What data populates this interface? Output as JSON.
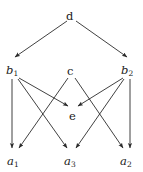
{
  "figure": {
    "type": "directed-graph",
    "title": "",
    "background_color": "#ffffff",
    "edge_color": "#2b2b2b",
    "label_color": "#1a1a1a"
  },
  "nodes": [
    {
      "id": "d",
      "base": "d",
      "sub": "",
      "italic": false,
      "x": 71,
      "y": 14,
      "label_left": 66,
      "label_top": 7
    },
    {
      "id": "b1",
      "base": "b",
      "sub": "1",
      "italic": true,
      "x": 14,
      "y": 68,
      "label_left": 6,
      "label_top": 61
    },
    {
      "id": "c",
      "base": "c",
      "sub": "",
      "italic": false,
      "x": 71,
      "y": 68,
      "label_left": 67,
      "label_top": 62
    },
    {
      "id": "b2",
      "base": "b",
      "sub": "2",
      "italic": true,
      "x": 128,
      "y": 68,
      "label_left": 121,
      "label_top": 61
    },
    {
      "id": "e",
      "base": "e",
      "sub": "",
      "italic": false,
      "x": 73,
      "y": 113,
      "label_left": 69,
      "label_top": 107
    },
    {
      "id": "a1",
      "base": "a",
      "sub": "1",
      "italic": true,
      "x": 14,
      "y": 158,
      "label_left": 7,
      "label_top": 152
    },
    {
      "id": "a3",
      "base": "a",
      "sub": "3",
      "italic": true,
      "x": 71,
      "y": 158,
      "label_left": 64,
      "label_top": 152
    },
    {
      "id": "a2",
      "base": "a",
      "sub": "2",
      "italic": true,
      "x": 128,
      "y": 158,
      "label_left": 120,
      "label_top": 152
    }
  ],
  "edges": [
    {
      "from": "d",
      "to": "b1"
    },
    {
      "from": "d",
      "to": "b2"
    },
    {
      "from": "b1",
      "to": "a1"
    },
    {
      "from": "b1",
      "to": "a3"
    },
    {
      "from": "b1",
      "to": "e"
    },
    {
      "from": "b2",
      "to": "a2"
    },
    {
      "from": "b2",
      "to": "a3"
    },
    {
      "from": "b2",
      "to": "e"
    },
    {
      "from": "c",
      "to": "a1"
    },
    {
      "from": "c",
      "to": "a2"
    }
  ],
  "edge_paths": {
    "d-b1": {
      "x1": 67,
      "y1": 21,
      "x2": 15,
      "y2": 57
    },
    "d-b2": {
      "x1": 76,
      "y1": 21,
      "x2": 127,
      "y2": 57
    },
    "b1-a1": {
      "x1": 12,
      "y1": 79,
      "x2": 12,
      "y2": 148
    },
    "b1-a3": {
      "x1": 18,
      "y1": 79,
      "x2": 67,
      "y2": 148
    },
    "b1-e": {
      "x1": 19,
      "y1": 78,
      "x2": 68,
      "y2": 106
    },
    "b2-a2": {
      "x1": 130,
      "y1": 79,
      "x2": 130,
      "y2": 148
    },
    "b2-a3": {
      "x1": 124,
      "y1": 79,
      "x2": 76,
      "y2": 148
    },
    "b2-e": {
      "x1": 123,
      "y1": 78,
      "x2": 78,
      "y2": 106
    },
    "c-a1": {
      "x1": 68,
      "y1": 78,
      "x2": 19,
      "y2": 148
    },
    "c-a2": {
      "x1": 75,
      "y1": 78,
      "x2": 123,
      "y2": 148
    }
  }
}
